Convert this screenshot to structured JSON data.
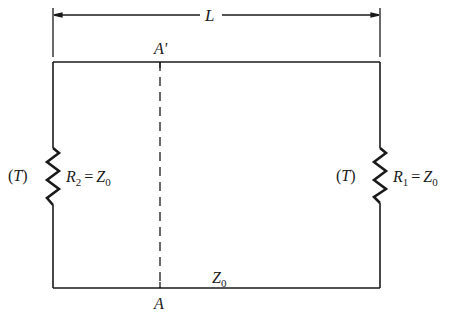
{
  "diagram": {
    "type": "transmission-line-circuit",
    "dimension": {
      "label": "L"
    },
    "cross_section": {
      "top_label": "A'",
      "bottom_label": "A"
    },
    "line": {
      "label": "Z",
      "label_sub": "0"
    },
    "left_resistor": {
      "temp_label": "(T)",
      "name": "R",
      "name_sub": "2",
      "equals": "=",
      "value": "Z",
      "value_sub": "0"
    },
    "right_resistor": {
      "temp_label": "(T)",
      "name": "R",
      "name_sub": "1",
      "equals": "=",
      "value": "Z",
      "value_sub": "0"
    }
  },
  "colors": {
    "stroke": "#1a1a1a",
    "background": "#ffffff"
  }
}
